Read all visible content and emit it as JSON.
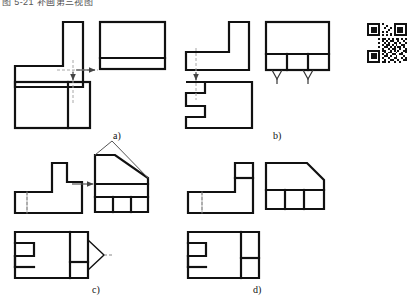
{
  "document": {
    "caption": "图 5-21  补画第三视图",
    "type": "orthographic-projection-exercise",
    "panel_count": 4
  },
  "panels": [
    {
      "id": "a",
      "label": "a)",
      "label_x": 113,
      "label_y": 130,
      "description": "Inverted-L front view with projection arrows; side view rectangle with low horizontal band; top view rectangle with right vertical divider",
      "views": [
        {
          "name": "front-view",
          "shape": "inverted-L"
        },
        {
          "name": "side-view",
          "shape": "rectangle-with-bottom-band"
        },
        {
          "name": "top-view",
          "shape": "rectangle-with-right-divider"
        }
      ]
    },
    {
      "id": "b",
      "label": "b)",
      "label_x": 273,
      "label_y": 130,
      "description": "Mirrored L front view; top view rectangle with left notch; side view rectangle with three-cell base band and two chamfer ticks",
      "views": [
        {
          "name": "front-view",
          "shape": "mirrored-L"
        },
        {
          "name": "top-view",
          "shape": "rectangle-with-left-notch"
        },
        {
          "name": "side-view",
          "shape": "rectangle-with-three-cell-band"
        }
      ]
    },
    {
      "id": "c",
      "label": "c)",
      "label_x": 92,
      "label_y": 288,
      "description": "Stepped L front view; side view house shape with sloped roof and three-cell base; top view notched rectangle with triangular point",
      "views": [
        {
          "name": "front-view",
          "shape": "stepped-L"
        },
        {
          "name": "side-view",
          "shape": "house-with-sloped-roof"
        },
        {
          "name": "top-view",
          "shape": "notched-rectangle-with-point"
        }
      ]
    },
    {
      "id": "d",
      "label": "d)",
      "label_x": 253,
      "label_y": 288,
      "description": "Stepped L front view with divided riser; side view rectangle with chamfered top-right corner and three-cell base; top view notched rectangle with two right cells",
      "views": [
        {
          "name": "front-view",
          "shape": "stepped-L-with-divider"
        },
        {
          "name": "side-view",
          "shape": "chamfered-rectangle-with-band"
        },
        {
          "name": "top-view",
          "shape": "notched-rectangle-two-cells"
        }
      ]
    }
  ],
  "style": {
    "outline_color": "#111111",
    "thin_line_color": "#555555",
    "centerline_color": "#999999",
    "background": "#ffffff",
    "outline_width": 2.2,
    "thin_width": 1.4
  },
  "qr_code": {
    "name": "qr-code",
    "present": true,
    "modules": 21
  }
}
